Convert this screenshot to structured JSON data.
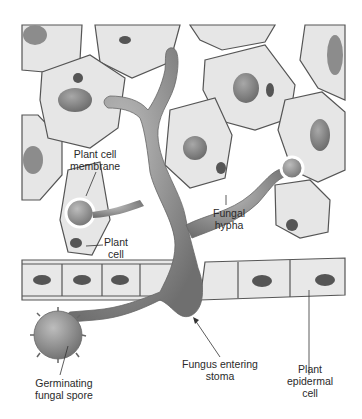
{
  "diagram": {
    "labels": {
      "plant_cell_membrane": [
        "Plant cell",
        "membrane"
      ],
      "plant_cell": [
        "Plant",
        "cell"
      ],
      "fungal_hypha": [
        "Fungal",
        "hypha"
      ],
      "fungus_entering_stoma": [
        "Fungus entering",
        "stoma"
      ],
      "germinating_spore": [
        "Germinating",
        "fungal spore"
      ],
      "plant_epidermal_cell": [
        "Plant",
        "epidermal",
        "cell"
      ]
    },
    "colors": {
      "cell_fill": "#e4e4e4",
      "cell_wall": "#555555",
      "organelle": "#8a8a8a",
      "nucleus": "#6e6e6e",
      "hypha": "#8c8c8c",
      "background": "#ffffff"
    }
  }
}
